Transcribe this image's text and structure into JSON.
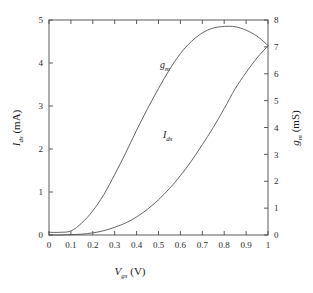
{
  "chart_data": {
    "type": "line",
    "title": "",
    "xlabel": "V_gs (V)",
    "ylabel": "I_ds (mA)",
    "y2label": "g_m (mS)",
    "xlim": [
      0,
      1
    ],
    "ylim": [
      0,
      5
    ],
    "y2lim": [
      0,
      8
    ],
    "grid": false,
    "legend": "inline-annotations",
    "xticks": [
      "0",
      "0.1",
      "0.2",
      "0.3",
      "0.4",
      "0.5",
      "0.6",
      "0.7",
      "0.8",
      "0.9",
      "1"
    ],
    "xtick_values": [
      0,
      0.1,
      0.2,
      0.3,
      0.4,
      0.5,
      0.6,
      0.7,
      0.8,
      0.9,
      1
    ],
    "yticks": [
      "0",
      "1",
      "2",
      "3",
      "4",
      "5"
    ],
    "ytick_values": [
      0,
      1,
      2,
      3,
      4,
      5
    ],
    "y2ticks": [
      "0",
      "1",
      "2",
      "3",
      "4",
      "5",
      "6",
      "7",
      "8"
    ],
    "y2tick_values": [
      0,
      1,
      2,
      3,
      4,
      5,
      6,
      7,
      8
    ],
    "x": [
      0,
      0.05,
      0.1,
      0.15,
      0.2,
      0.25,
      0.3,
      0.35,
      0.4,
      0.45,
      0.5,
      0.55,
      0.6,
      0.65,
      0.7,
      0.75,
      0.8,
      0.85,
      0.9,
      0.95,
      1.0
    ],
    "series": [
      {
        "name": "I_ds",
        "axis": "left",
        "units": "mA",
        "label": "I_ds",
        "color": "#555555",
        "values": [
          0.0,
          0.0,
          0.01,
          0.02,
          0.05,
          0.1,
          0.18,
          0.28,
          0.42,
          0.6,
          0.82,
          1.08,
          1.38,
          1.72,
          2.1,
          2.5,
          2.94,
          3.4,
          3.78,
          4.12,
          4.4
        ]
      },
      {
        "name": "g_m",
        "axis": "right",
        "units": "mS",
        "label": "g_m",
        "color": "#555555",
        "values": [
          0.1,
          0.1,
          0.15,
          0.45,
          0.9,
          1.5,
          2.25,
          3.05,
          3.9,
          4.7,
          5.45,
          6.15,
          6.75,
          7.2,
          7.52,
          7.7,
          7.76,
          7.75,
          7.62,
          7.4,
          7.05
        ]
      }
    ],
    "annotations": [
      {
        "text": "g_m",
        "x": 0.5,
        "axis": "right",
        "value": 6.0
      },
      {
        "text": "I_ds",
        "x": 0.58,
        "axis": "left",
        "value": 2.2
      }
    ],
    "crossing_point": {
      "x": 1.0,
      "left_value": 4.4,
      "right_value": 7.05
    }
  },
  "axes": {
    "x_title_main": "V",
    "x_title_sub": "gs",
    "x_title_unit": " (V)",
    "y_left_main": "I",
    "y_left_sub": "ds",
    "y_left_unit": " (mA)",
    "y_right_main": "g",
    "y_right_sub": "m",
    "y_right_unit": " (mS)"
  },
  "annotation_labels": {
    "gm_main": "g",
    "gm_sub": "m",
    "ids_main": "I",
    "ids_sub": "ds"
  },
  "style": {
    "line_color": "#555555",
    "axis_color": "#4a4a4a",
    "text_color": "#1a1a1a",
    "background": "#ffffff"
  }
}
